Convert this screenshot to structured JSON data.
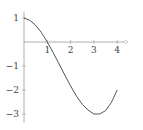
{
  "chart_data": {
    "type": "line",
    "title": "",
    "xlabel": "",
    "ylabel": "",
    "xlim": [
      0,
      4.2
    ],
    "ylim": [
      -3.2,
      1.1
    ],
    "grid": false,
    "legend": null,
    "x_ticks": [
      1,
      2,
      3,
      4
    ],
    "x_tick_labels": [
      "1",
      "2",
      "3",
      "4"
    ],
    "y_ticks": [
      1,
      -1,
      -2,
      -3
    ],
    "y_tick_labels": [
      "1",
      "−1",
      "−2",
      "−3"
    ],
    "series": [
      {
        "name": "f(x)",
        "color": "#555555",
        "x": [
          0,
          0.25,
          0.5,
          0.75,
          1,
          1.25,
          1.5,
          1.75,
          2,
          2.25,
          2.5,
          2.75,
          3,
          3.25,
          3.5,
          3.75,
          4
        ],
        "y": [
          1,
          0.904,
          0.698,
          0.39,
          0,
          -0.44,
          -0.906,
          -1.375,
          -1.833,
          -2.253,
          -2.594,
          -2.84,
          -3.0,
          -3.0,
          -2.86,
          -2.52,
          -2.0
        ]
      }
    ]
  },
  "axis": {
    "color": "#999999"
  }
}
